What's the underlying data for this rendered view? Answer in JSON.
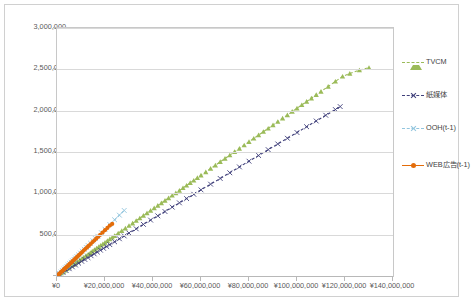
{
  "chart_data": {
    "type": "scatter",
    "title": "",
    "xlabel": "",
    "ylabel": "",
    "xlim": [
      0,
      140000000
    ],
    "ylim": [
      0,
      3000000
    ],
    "grid": true,
    "legend_position": "right",
    "x_ticks": [
      "¥0",
      "¥20,000,000",
      "¥40,000,000",
      "¥60,000,000",
      "¥80,000,000",
      "¥100,000,000",
      "¥120,000,000",
      "¥140,000,000"
    ],
    "x_tick_values": [
      0,
      20000000,
      40000000,
      60000000,
      80000000,
      100000000,
      120000000,
      140000000
    ],
    "y_ticks": [
      "0",
      "500,000",
      "1,000,000",
      "1,500,000",
      "2,000,000",
      "2,500,000",
      "3,000,000"
    ],
    "y_tick_values": [
      0,
      500000,
      1000000,
      1500000,
      2000000,
      2500000,
      3000000
    ],
    "series": [
      {
        "name": "TVCM",
        "color": "#9bbb59",
        "marker": "triangle",
        "line_style": "dashed",
        "points": [
          [
            900000,
            18000
          ],
          [
            1800000,
            36000
          ],
          [
            2700000,
            55000
          ],
          [
            3400000,
            70000
          ],
          [
            4200000,
            86000
          ],
          [
            5100000,
            104000
          ],
          [
            6000000,
            122000
          ],
          [
            6900000,
            140000
          ],
          [
            7700000,
            157000
          ],
          [
            8600000,
            175000
          ],
          [
            9500000,
            193000
          ],
          [
            10400000,
            211000
          ],
          [
            11200000,
            228000
          ],
          [
            12100000,
            246000
          ],
          [
            13000000,
            264000
          ],
          [
            13900000,
            282000
          ],
          [
            14700000,
            299000
          ],
          [
            15600000,
            317000
          ],
          [
            16500000,
            335000
          ],
          [
            17400000,
            353000
          ],
          [
            18200000,
            370000
          ],
          [
            19100000,
            388000
          ],
          [
            20000000,
            406000
          ],
          [
            21000000,
            426000
          ],
          [
            22000000,
            447000
          ],
          [
            23000000,
            467000
          ],
          [
            24000000,
            487000
          ],
          [
            25500000,
            518000
          ],
          [
            27000000,
            548000
          ],
          [
            28500000,
            578000
          ],
          [
            30000000,
            609000
          ],
          [
            31500000,
            639000
          ],
          [
            33000000,
            670000
          ],
          [
            34500000,
            700000
          ],
          [
            36000000,
            731000
          ],
          [
            37500000,
            761000
          ],
          [
            39000000,
            792000
          ],
          [
            40500000,
            822000
          ],
          [
            42000000,
            853000
          ],
          [
            43500000,
            883000
          ],
          [
            45000000,
            914000
          ],
          [
            46500000,
            944000
          ],
          [
            48000000,
            975000
          ],
          [
            49500000,
            1005000
          ],
          [
            51000000,
            1035000
          ],
          [
            52500000,
            1066000
          ],
          [
            54000000,
            1096000
          ],
          [
            55500000,
            1127000
          ],
          [
            57000000,
            1157000
          ],
          [
            58500000,
            1188000
          ],
          [
            60000000,
            1218000
          ],
          [
            62000000,
            1259000
          ],
          [
            64000000,
            1300000
          ],
          [
            66000000,
            1340000
          ],
          [
            68000000,
            1381000
          ],
          [
            70000000,
            1421000
          ],
          [
            72000000,
            1462000
          ],
          [
            74000000,
            1502000
          ],
          [
            76000000,
            1543000
          ],
          [
            78000000,
            1583000
          ],
          [
            80000000,
            1624000
          ],
          [
            82000000,
            1665000
          ],
          [
            84000000,
            1705000
          ],
          [
            86000000,
            1746000
          ],
          [
            88000000,
            1786000
          ],
          [
            90000000,
            1827000
          ],
          [
            92000000,
            1867000
          ],
          [
            94000000,
            1908000
          ],
          [
            96000000,
            1948000
          ],
          [
            98000000,
            1989000
          ],
          [
            100000000,
            2030000
          ],
          [
            102000000,
            2070000
          ],
          [
            104000000,
            2111000
          ],
          [
            106000000,
            2151000
          ],
          [
            108000000,
            2192000
          ],
          [
            110000000,
            2232000
          ],
          [
            113000000,
            2293000
          ],
          [
            116000000,
            2354000
          ],
          [
            119000000,
            2415000
          ],
          [
            122000000,
            2450000
          ],
          [
            126000000,
            2490000
          ],
          [
            130000000,
            2520000
          ]
        ]
      },
      {
        "name": "紙媒体",
        "color": "#3f3f7a",
        "marker": "x",
        "line_style": "dashed",
        "points": [
          [
            1200000,
            12000
          ],
          [
            2500000,
            25000
          ],
          [
            3800000,
            38000
          ],
          [
            5100000,
            51000
          ],
          [
            6400000,
            64000
          ],
          [
            7700000,
            77000
          ],
          [
            9000000,
            90000
          ],
          [
            10300000,
            103000
          ],
          [
            11600000,
            116000
          ],
          [
            12900000,
            129000
          ],
          [
            14200000,
            142000
          ],
          [
            15500000,
            155000
          ],
          [
            16800000,
            168000
          ],
          [
            18100000,
            181000
          ],
          [
            19400000,
            194000
          ],
          [
            20700000,
            207000
          ],
          [
            22000000,
            220000
          ],
          [
            24000000,
            240000
          ],
          [
            26000000,
            261000
          ],
          [
            28000000,
            281000
          ],
          [
            30000000,
            301000
          ],
          [
            33000000,
            331000
          ],
          [
            36000000,
            362000
          ],
          [
            39000000,
            392000
          ],
          [
            42000000,
            422000
          ],
          [
            45000000,
            452000
          ],
          [
            48000000,
            483000
          ],
          [
            51000000,
            513000
          ],
          [
            54000000,
            543000
          ],
          [
            57000000,
            573000
          ],
          [
            60000000,
            604000
          ],
          [
            64000000,
            644000
          ],
          [
            68000000,
            684000
          ],
          [
            72000000,
            724000
          ],
          [
            76000000,
            765000
          ],
          [
            80000000,
            805000
          ],
          [
            84000000,
            845000
          ],
          [
            88000000,
            886000
          ],
          [
            92000000,
            926000
          ],
          [
            96000000,
            966000
          ],
          [
            100000000,
            1006000
          ],
          [
            104000000,
            1047000
          ],
          [
            108000000,
            1087000
          ],
          [
            112000000,
            1127000
          ],
          [
            116000000,
            1167000
          ],
          [
            118000000,
            1188000
          ]
        ],
        "note": "endpoint at approximately (118,000,000, 2,050,000) on rendered scale"
      },
      {
        "name": "OOH(t-1)",
        "color": "#92c5de",
        "marker": "x",
        "line_style": "dashed",
        "points": [
          [
            500000,
            14000
          ],
          [
            1100000,
            31000
          ],
          [
            1700000,
            48000
          ],
          [
            2300000,
            65000
          ],
          [
            2900000,
            82000
          ],
          [
            3500000,
            99000
          ],
          [
            4100000,
            116000
          ],
          [
            4700000,
            133000
          ],
          [
            5300000,
            150000
          ],
          [
            5900000,
            167000
          ],
          [
            6500000,
            184000
          ],
          [
            7100000,
            201000
          ],
          [
            7700000,
            218000
          ],
          [
            8300000,
            235000
          ],
          [
            9000000,
            255000
          ],
          [
            9800000,
            277000
          ],
          [
            10600000,
            300000
          ],
          [
            11400000,
            323000
          ],
          [
            12200000,
            345000
          ],
          [
            13000000,
            368000
          ],
          [
            14000000,
            396000
          ],
          [
            15000000,
            425000
          ],
          [
            16000000,
            453000
          ],
          [
            17000000,
            481000
          ],
          [
            18500000,
            524000
          ],
          [
            20000000,
            566000
          ],
          [
            22000000,
            623000
          ],
          [
            24000000,
            680000
          ],
          [
            26000000,
            736000
          ],
          [
            28000000,
            793000
          ]
        ]
      },
      {
        "name": "WEB広告(t-1)",
        "color": "#e36c0a",
        "marker": "circle",
        "line_style": "solid",
        "points": [
          [
            300000,
            8000
          ],
          [
            700000,
            19000
          ],
          [
            1100000,
            30000
          ],
          [
            1500000,
            41000
          ],
          [
            1900000,
            52000
          ],
          [
            2300000,
            63000
          ],
          [
            2700000,
            74000
          ],
          [
            3100000,
            85000
          ],
          [
            3500000,
            96000
          ],
          [
            3900000,
            107000
          ],
          [
            4300000,
            118000
          ],
          [
            4700000,
            129000
          ],
          [
            5100000,
            140000
          ],
          [
            5500000,
            151000
          ],
          [
            5900000,
            162000
          ],
          [
            6400000,
            176000
          ],
          [
            6900000,
            190000
          ],
          [
            7400000,
            204000
          ],
          [
            7900000,
            218000
          ],
          [
            8400000,
            232000
          ],
          [
            8900000,
            246000
          ],
          [
            9400000,
            260000
          ],
          [
            9900000,
            274000
          ],
          [
            10500000,
            290000
          ],
          [
            11200000,
            310000
          ],
          [
            11900000,
            329000
          ],
          [
            12600000,
            349000
          ],
          [
            13300000,
            368000
          ],
          [
            14000000,
            387000
          ],
          [
            14800000,
            410000
          ],
          [
            15600000,
            432000
          ],
          [
            16400000,
            454000
          ],
          [
            17200000,
            476000
          ],
          [
            18000000,
            498000
          ],
          [
            19000000,
            526000
          ],
          [
            20000000,
            554000
          ],
          [
            21000000,
            582000
          ],
          [
            22000000,
            610000
          ],
          [
            23000000,
            630000
          ]
        ]
      }
    ]
  },
  "legend": {
    "items": [
      {
        "label": "TVCM"
      },
      {
        "label": "紙媒体"
      },
      {
        "label": "OOH(t-1)"
      },
      {
        "label": "WEB広告(t-1)"
      }
    ]
  }
}
